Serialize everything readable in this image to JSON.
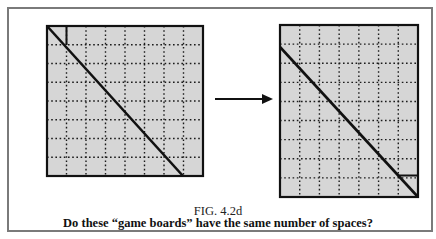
{
  "figure": {
    "label": "FIG. 4.2d",
    "question": "Do these “game boards” have the same number of spaces?"
  },
  "boards": [
    {
      "name": "left-board",
      "columns": 8,
      "rows": 8,
      "x": 47,
      "y": 26,
      "width": 156,
      "height": 150,
      "diagonal": {
        "x1": 47,
        "y1": 26,
        "x2": 183,
        "y2": 176
      },
      "extra_segment": {
        "x1": 66.5,
        "y1": 26,
        "x2": 66.5,
        "y2": 45
      }
    },
    {
      "name": "right-board",
      "columns": 7,
      "rows": 9,
      "x": 280,
      "y": 25,
      "width": 138,
      "height": 172,
      "diagonal": {
        "x1": 280,
        "y1": 47,
        "x2": 418,
        "y2": 197
      },
      "extra_segment": {
        "x1": 398,
        "y1": 175.5,
        "x2": 418,
        "y2": 175.5
      }
    }
  ],
  "arrow": {
    "x1": 215,
    "y1": 99,
    "x2": 273,
    "y2": 99,
    "direction": "right"
  },
  "colors": {
    "board_fill": "#d6d6d6",
    "grid_line": "#1a1a1a",
    "outline": "#111111",
    "frame": "#7a7a7a"
  }
}
